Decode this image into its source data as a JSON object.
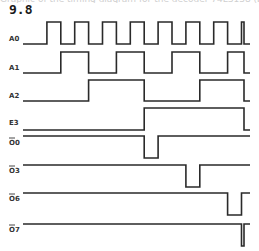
{
  "header": {
    "top_fragment": "Graphic of the timing diagram for the decoder 74LS138 (b) ...",
    "figure_number": "9.8"
  },
  "diagram": {
    "type": "timing-diagram",
    "time_units": 16,
    "signals": [
      {
        "id": "a0",
        "label": "A0",
        "active_low": false,
        "initial": 0,
        "transitions": [
          1,
          2,
          3,
          4,
          5,
          6,
          7,
          8,
          9,
          10,
          11,
          12,
          13,
          14,
          15,
          16
        ]
      },
      {
        "id": "a1",
        "label": "A1",
        "active_low": false,
        "initial": 0,
        "transitions": [
          2,
          4,
          6,
          8,
          10,
          12,
          14,
          16
        ]
      },
      {
        "id": "a2",
        "label": "A2",
        "active_low": false,
        "initial": 0,
        "transitions": [
          4,
          8,
          12,
          16
        ]
      },
      {
        "id": "e3",
        "label": "E3",
        "active_low": false,
        "initial": 0,
        "transitions": [
          8,
          16
        ]
      },
      {
        "id": "o0",
        "label": "O0",
        "active_low": true,
        "initial": 1,
        "transitions": [
          8,
          9
        ]
      },
      {
        "id": "o3",
        "label": "O3",
        "active_low": true,
        "initial": 1,
        "transitions": [
          11,
          12
        ]
      },
      {
        "id": "o6",
        "label": "O6",
        "active_low": true,
        "initial": 1,
        "transitions": [
          14,
          15
        ]
      },
      {
        "id": "o7",
        "label": "O7",
        "active_low": true,
        "initial": 1,
        "transitions": [
          15,
          16
        ]
      }
    ]
  }
}
